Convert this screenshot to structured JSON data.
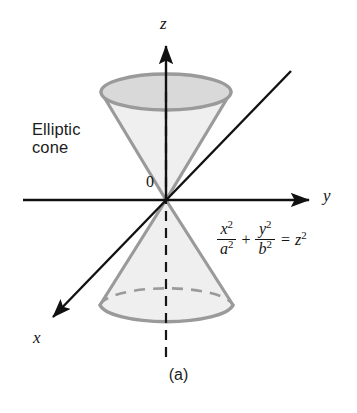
{
  "figure": {
    "caption": "(a)",
    "surface_name_line1": "Elliptic",
    "surface_name_line2": "cone",
    "origin_label": "0",
    "background_color": "#ffffff"
  },
  "axes": {
    "z_label": "z",
    "y_label": "y",
    "x_label": "x",
    "axis_color": "#111111",
    "origin_point": {
      "x": 166,
      "y": 200
    },
    "z_axis": {
      "from": [
        166,
        200
      ],
      "to": [
        166,
        45
      ],
      "arrow": true,
      "label_pos": [
        160,
        14
      ]
    },
    "y_axis": {
      "from": [
        23,
        200
      ],
      "to": [
        311,
        200
      ],
      "arrow": true,
      "label_pos": [
        323,
        186
      ]
    },
    "x_axis": {
      "from": [
        291,
        71
      ],
      "to": [
        52,
        318
      ],
      "arrow": true,
      "label_pos": [
        33,
        328
      ]
    },
    "z_axis_dashed_extension": {
      "from": [
        166,
        200
      ],
      "to": [
        166,
        357
      ]
    },
    "z_axis_dashed_upper": {
      "from": [
        166,
        200
      ],
      "to": [
        166,
        92
      ]
    }
  },
  "equation": {
    "numerator_1": "x",
    "numerator_1_power": "2",
    "denominator_1": "a",
    "denominator_1_power": "2",
    "operator": "+",
    "numerator_2": "y",
    "numerator_2_power": "2",
    "denominator_2": "b",
    "denominator_2_power": "2",
    "equals": "=",
    "rhs": "z",
    "rhs_power": "2",
    "plain_text": "x^2/a^2 + y^2/b^2 = z^2"
  },
  "cone": {
    "stroke_color": "#9a9a9a",
    "fill_color": "#efefef",
    "top_ellipse_fill": "#d8d8d8",
    "apex": {
      "x": 166,
      "y": 200
    },
    "top_ellipse": {
      "cx": 166,
      "cy": 92,
      "rx": 65,
      "ry": 18
    },
    "bottom_ellipse": {
      "cx": 166,
      "cy": 305,
      "rx": 67,
      "ry": 19
    },
    "upper_nappe_opens": "up",
    "lower_nappe_opens": "down",
    "hidden_edge_style": "dashed"
  }
}
